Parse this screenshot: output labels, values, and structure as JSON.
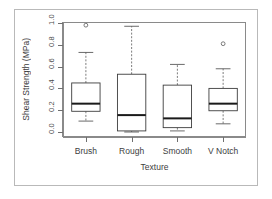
{
  "chart_data": {
    "type": "boxplot",
    "title": "",
    "xlabel": "Texture",
    "ylabel": "Shear Strength (MPa)",
    "ylim": [
      0.0,
      1.0
    ],
    "grid": false,
    "legend": null,
    "yticks": [
      0.0,
      0.2,
      0.4,
      0.6,
      0.8,
      1.0
    ],
    "ytick_labels": [
      "0.0",
      "0.2",
      "0.4",
      "0.6",
      "0.8",
      "1.0"
    ],
    "categories": [
      "Brush",
      "Rough",
      "Smooth",
      "V Notch"
    ],
    "boxes": [
      {
        "category": "Brush",
        "whisker_low": 0.1,
        "q1": 0.19,
        "median": 0.26,
        "q3": 0.45,
        "whisker_high": 0.73,
        "outliers": [
          0.98
        ]
      },
      {
        "category": "Rough",
        "whisker_low": 0.0,
        "q1": 0.01,
        "median": 0.155,
        "q3": 0.53,
        "whisker_high": 0.97,
        "outliers": []
      },
      {
        "category": "Smooth",
        "whisker_low": 0.01,
        "q1": 0.04,
        "median": 0.125,
        "q3": 0.43,
        "whisker_high": 0.62,
        "outliers": []
      },
      {
        "category": "V Notch",
        "whisker_low": 0.075,
        "q1": 0.195,
        "median": 0.26,
        "q3": 0.4,
        "whisker_high": 0.58,
        "outliers": [
          0.81
        ]
      }
    ],
    "colors": {
      "box_stroke": "#3d3d3d",
      "median_stroke": "#1a1a1a",
      "whisker_stroke": "#5a5a5a",
      "outlier_stroke": "#5a5a5a",
      "axis": "#8a8a8a",
      "frame_border": "#b9b9b9",
      "background": "#ffffff"
    }
  }
}
